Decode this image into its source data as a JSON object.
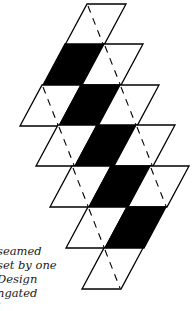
{
  "diagram": {
    "cell": {
      "top_width": 39,
      "height": 41,
      "skew": -22
    },
    "colors": {
      "fill_dark": "#000000",
      "fill_light": "#ffffff",
      "stroke": "#000000",
      "seam": "#000000"
    },
    "rows": [
      {
        "y": 4,
        "x0": 87,
        "cells": [
          "white"
        ]
      },
      {
        "y": 44,
        "x0": 65,
        "cells": [
          "black",
          "white"
        ]
      },
      {
        "y": 85,
        "x0": 42,
        "cells": [
          "white",
          "black",
          "white"
        ]
      },
      {
        "y": 125,
        "x0": 58,
        "cells": [
          "white",
          "black",
          "white"
        ]
      },
      {
        "y": 166,
        "x0": 72,
        "cells": [
          "white",
          "black",
          "white"
        ]
      },
      {
        "y": 207,
        "x0": 88,
        "cells": [
          "white",
          "black"
        ]
      },
      {
        "y": 248,
        "x0": 104,
        "cells": [
          "white"
        ]
      }
    ]
  },
  "caption": {
    "lines": [
      "seamed",
      "set by one",
      "Design",
      "ngated",
      "i"
    ]
  }
}
